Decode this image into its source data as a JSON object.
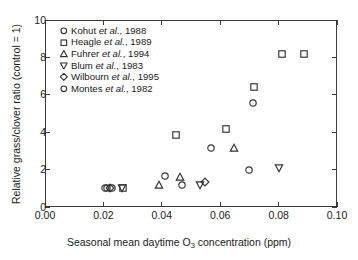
{
  "chart_data": {
    "type": "scatter",
    "title": "",
    "xlabel": "Seasonal mean daytime O3 concentration (ppm)",
    "xlabel_prefix": "Seasonal mean daytime O",
    "xlabel_sub": "3",
    "xlabel_suffix": " concentration (ppm)",
    "ylabel": "Relative grass/clover ratio (control = 1)",
    "xlim": [
      0.0,
      0.1
    ],
    "ylim": [
      0,
      10
    ],
    "xticks": [
      0.0,
      0.02,
      0.04,
      0.06,
      0.08,
      0.1
    ],
    "xticklabels": [
      "0.00",
      "0.02",
      "0.04",
      "0.06",
      "0.08",
      "0.10"
    ],
    "yticks": [
      0,
      2,
      4,
      6,
      8,
      10
    ],
    "yticklabels": [
      "0",
      "2",
      "4",
      "6",
      "8",
      "10"
    ],
    "grid": false,
    "legend_position": "upper-left-inside",
    "series": [
      {
        "name": "Kohut et al., 1988",
        "label_author": "Kohut ",
        "label_etal": "et al.",
        "label_year": ", 1988",
        "marker": "circle",
        "color": "#333333",
        "points": [
          {
            "x": 0.0205,
            "y": 1.0
          },
          {
            "x": 0.0228,
            "y": 1.0
          },
          {
            "x": 0.0412,
            "y": 1.65
          },
          {
            "x": 0.0468,
            "y": 1.2
          },
          {
            "x": 0.057,
            "y": 3.15
          },
          {
            "x": 0.07,
            "y": 2.0
          },
          {
            "x": 0.0712,
            "y": 5.55
          }
        ]
      },
      {
        "name": "Heagle et al., 1989",
        "label_author": "Heagle ",
        "label_etal": "et al.",
        "label_year": ", 1989",
        "marker": "square",
        "color": "#333333",
        "points": [
          {
            "x": 0.0268,
            "y": 1.0
          },
          {
            "x": 0.045,
            "y": 3.85
          },
          {
            "x": 0.062,
            "y": 4.15
          },
          {
            "x": 0.0715,
            "y": 6.4
          },
          {
            "x": 0.081,
            "y": 8.2
          },
          {
            "x": 0.0888,
            "y": 8.2
          }
        ]
      },
      {
        "name": "Fuhrer et al., 1994",
        "label_author": "Fuhrer ",
        "label_etal": "et al.",
        "label_year": ", 1994",
        "marker": "triangle-up",
        "color": "#333333",
        "points": [
          {
            "x": 0.039,
            "y": 1.2
          },
          {
            "x": 0.0462,
            "y": 1.6
          },
          {
            "x": 0.0648,
            "y": 3.15
          }
        ]
      },
      {
        "name": "Blum et al., 1983",
        "label_author": "Blum ",
        "label_etal": "et al.",
        "label_year": ", 1983",
        "marker": "triangle-down",
        "color": "#333333",
        "points": [
          {
            "x": 0.0262,
            "y": 1.0
          },
          {
            "x": 0.053,
            "y": 1.15
          },
          {
            "x": 0.08,
            "y": 2.1
          }
        ]
      },
      {
        "name": "Wilbourn et al., 1995",
        "label_author": "Wilbourn ",
        "label_etal": "et al.",
        "label_year": ", 1995",
        "marker": "diamond",
        "color": "#333333",
        "points": [
          {
            "x": 0.0222,
            "y": 1.0
          },
          {
            "x": 0.0548,
            "y": 1.35
          }
        ]
      },
      {
        "name": "Montes et al., 1982",
        "label_author": "Montes ",
        "label_etal": "et al.",
        "label_year": ", 1982",
        "marker": "circle",
        "color": "#333333",
        "points": [
          {
            "x": 0.0212,
            "y": 1.0
          }
        ]
      }
    ]
  }
}
